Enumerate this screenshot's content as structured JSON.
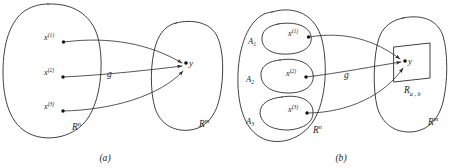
{
  "figure": {
    "stroke_color": "#2b2b2b",
    "text_color": "#1a1a1a",
    "background": "#ffffff"
  },
  "panel_a": {
    "caption": "(a)",
    "domain_label": {
      "base": "R",
      "sup": "n"
    },
    "codomain_label": {
      "base": "R",
      "sup": "m"
    },
    "map_label": "g",
    "image_point_label": "y",
    "points": [
      {
        "name": "x",
        "sup": "(1)"
      },
      {
        "name": "x",
        "sup": "(2)"
      },
      {
        "name": "x",
        "sup": "(3)"
      }
    ]
  },
  "panel_b": {
    "caption": "(b)",
    "domain_label": {
      "base": "R",
      "sup": "n"
    },
    "codomain_label": {
      "base": "R",
      "sup": "m"
    },
    "map_label": "g",
    "image_point_label": "y",
    "image_region_label": {
      "base": "R",
      "sub": "a , b"
    },
    "subsets": [
      {
        "set": "A",
        "set_sub": "1",
        "point": "x",
        "point_sup": "(1)"
      },
      {
        "set": "A",
        "set_sub": "2",
        "point": "x",
        "point_sup": "(2)"
      },
      {
        "set": "A",
        "set_sub": "3",
        "point": "x",
        "point_sup": "(3)"
      }
    ]
  }
}
